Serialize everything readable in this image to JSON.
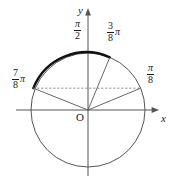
{
  "figure": {
    "axes": {
      "y_label": "y",
      "x_label": "x",
      "origin_label": "O"
    },
    "labels": {
      "pi_over_2": {
        "numerator": "π",
        "denominator": "2"
      },
      "three_eighths_pi": {
        "numerator": "3",
        "denominator": "8",
        "suffix": "π"
      },
      "seven_eighths_pi": {
        "numerator": "7",
        "denominator": "8",
        "suffix": "π"
      },
      "pi_over_8": {
        "numerator": "π",
        "denominator": "8"
      }
    },
    "colors": {
      "stroke": "#555555",
      "bold_arc": "#111111",
      "text": "#1a1a1a",
      "dashed": "#777777",
      "background": "#ffffff"
    },
    "geometry": {
      "center_x": 88,
      "center_y": 110,
      "radius": 57,
      "marked_angles_pi_units": [
        0.125,
        0.375,
        0.875
      ],
      "bold_arc_from_pi_units": 0.375,
      "bold_arc_to_pi_units": 0.875,
      "dashed_chord_at_angle_pi_units": 0.125
    }
  }
}
